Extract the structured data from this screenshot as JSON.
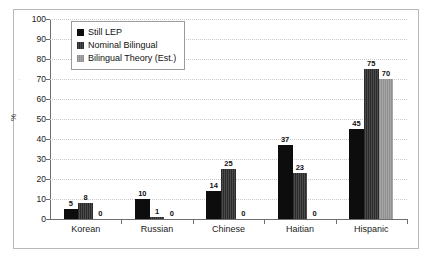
{
  "chart_data": {
    "type": "bar",
    "title": "",
    "subtitle": "",
    "xlabel": "",
    "ylabel": "%",
    "ylim": [
      0,
      100
    ],
    "ytick_step": 10,
    "yticks": [
      0,
      10,
      20,
      30,
      40,
      50,
      60,
      70,
      80,
      90,
      100
    ],
    "grid": true,
    "grid_style": "dotted-horizontal",
    "legend_position": "top-left-inside",
    "categories": [
      "Korean",
      "Russian",
      "Chinese",
      "Haitian",
      "Hispanic"
    ],
    "series": [
      {
        "name": "Still LEP",
        "color": "#0d0d0d",
        "values": [
          5,
          10,
          14,
          37,
          45
        ]
      },
      {
        "name": "Nominal Bilingual",
        "color": "#3a3a3a",
        "values": [
          8,
          1,
          25,
          23,
          75
        ]
      },
      {
        "name": "Bilingual Theory (Est.)",
        "color": "#9a9a9a",
        "values": [
          0,
          0,
          0,
          0,
          70
        ]
      }
    ],
    "data_labels": [
      [
        "5",
        "8",
        "0"
      ],
      [
        "10",
        "1",
        "0"
      ],
      [
        "14",
        "25",
        "0"
      ],
      [
        "37",
        "23",
        "0"
      ],
      [
        "45",
        "75",
        "70"
      ]
    ]
  },
  "axis": {
    "y_title": "%",
    "y_labels": [
      "100",
      "90",
      "80",
      "70",
      "60",
      "50",
      "40",
      "30",
      "20",
      "10",
      "0"
    ]
  },
  "legend": {
    "items": [
      {
        "label": "Still LEP"
      },
      {
        "label": "Nominal Bilingual"
      },
      {
        "label": "Bilingual Theory (Est.)"
      }
    ]
  },
  "colors": {
    "series_1": "#0d0d0d",
    "series_2": "#3a3a3a",
    "series_3": "#9a9a9a",
    "gridline": "#c8c8c8",
    "axis": "#6e6e6e",
    "frame": "#b9b9b9",
    "background": "#ffffff"
  }
}
